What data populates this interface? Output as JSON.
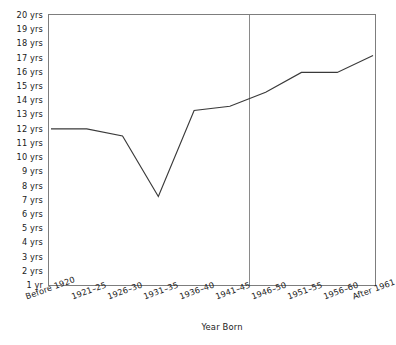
{
  "chart_data": {
    "type": "line",
    "title": "",
    "xlabel": "Year Born",
    "ylabel": "",
    "categories": [
      "Before 1920",
      "1921–25",
      "1926–30",
      "1931–35",
      "1936–40",
      "1941–45",
      "1946–50",
      "1951–55",
      "1956–60",
      "After 1961"
    ],
    "values": [
      12.0,
      12.0,
      11.5,
      7.2,
      13.3,
      13.6,
      14.6,
      16.0,
      16.0,
      17.2
    ],
    "y_tick_labels": [
      "20 yrs",
      "19 yrs",
      "18 yrs",
      "17 yrs",
      "16 yrs",
      "15 yrs",
      "14 yrs",
      "13 yrs",
      "12 yrs",
      "11 yrs",
      "10 yrs",
      "9 yrs",
      "8 yrs",
      "7 yrs",
      "6 yrs",
      "5 yrs",
      "4 yrs",
      "3 yrs",
      "2 yrs",
      "1 yr"
    ],
    "y_tick_values": [
      20,
      19,
      18,
      17,
      16,
      15,
      14,
      13,
      12,
      11,
      10,
      9,
      8,
      7,
      6,
      5,
      4,
      3,
      2,
      1
    ],
    "ylim": [
      1,
      20
    ],
    "grid": false,
    "legend": null,
    "annotations": [
      {
        "name": "vertical-reference-line",
        "type": "vline",
        "between": [
          "1941–45",
          "1946–50"
        ],
        "color": "#8a8a8a"
      }
    ],
    "colors": {
      "line": "#3a3a3a",
      "frame": "#7a7a7a",
      "divider": "#8a8a8a",
      "text": "#1a1a1a",
      "background": "#ffffff"
    }
  }
}
